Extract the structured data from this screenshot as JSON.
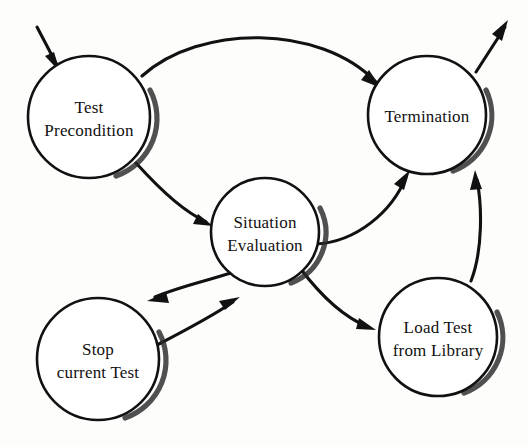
{
  "diagram": {
    "type": "state-transition-diagram",
    "background_color": "#fdfdfc",
    "stroke_color": "#111111",
    "nodes": [
      {
        "id": "test-precondition",
        "label_line1": "Test",
        "label_line2": "Precondition",
        "cx": 89,
        "cy": 117,
        "r": 61
      },
      {
        "id": "termination",
        "label_line1": "Termination",
        "label_line2": "",
        "cx": 427,
        "cy": 115,
        "r": 59
      },
      {
        "id": "situation-evaluation",
        "label_line1": "Situation",
        "label_line2": "Evaluation",
        "cx": 265,
        "cy": 232,
        "r": 54
      },
      {
        "id": "stop-current-test",
        "label_line1": "Stop",
        "label_line2": "current Test",
        "cx": 98,
        "cy": 359,
        "r": 61
      },
      {
        "id": "load-test-from-library",
        "label_line1": "Load Test",
        "label_line2": "from Library",
        "cx": 438,
        "cy": 337,
        "r": 59
      }
    ],
    "edges": [
      {
        "id": "entry-to-test-precondition",
        "from": "start",
        "to": "test-precondition",
        "label": ""
      },
      {
        "id": "test-precondition-to-termination",
        "from": "test-precondition",
        "to": "termination",
        "label": ""
      },
      {
        "id": "test-precondition-to-situation-evaluation",
        "from": "test-precondition",
        "to": "situation-evaluation",
        "label": ""
      },
      {
        "id": "situation-evaluation-to-termination",
        "from": "situation-evaluation",
        "to": "termination",
        "label": ""
      },
      {
        "id": "situation-evaluation-to-stop-current-test",
        "from": "situation-evaluation",
        "to": "stop-current-test",
        "label": ""
      },
      {
        "id": "stop-current-test-to-situation-evaluation",
        "from": "stop-current-test",
        "to": "situation-evaluation",
        "label": ""
      },
      {
        "id": "situation-evaluation-to-load-test",
        "from": "situation-evaluation",
        "to": "load-test-from-library",
        "label": ""
      },
      {
        "id": "load-test-to-termination",
        "from": "load-test-from-library",
        "to": "termination",
        "label": ""
      },
      {
        "id": "termination-to-exit",
        "from": "termination",
        "to": "exit",
        "label": ""
      }
    ]
  }
}
